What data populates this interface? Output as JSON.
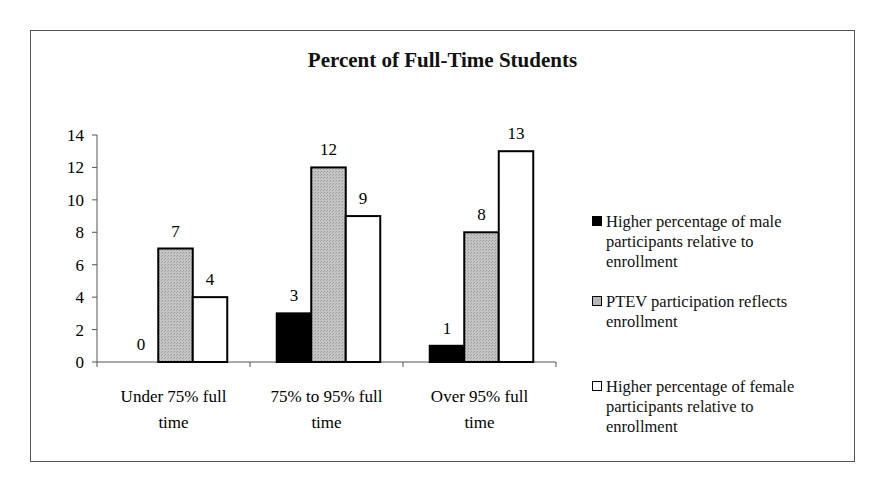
{
  "chart_data": {
    "type": "bar",
    "title": "Percent of Full-Time Students",
    "xlabel": "",
    "ylabel": "",
    "ylim": [
      0,
      14
    ],
    "yticks": [
      0,
      2,
      4,
      6,
      8,
      10,
      12,
      14
    ],
    "grid": false,
    "legend_position": "right",
    "categories": [
      "Under 75% full time",
      "75% to 95% full time",
      "Over 95% full time"
    ],
    "series": [
      {
        "name": "Higher percentage of male participants relative to enrollment",
        "color": "#000000",
        "values": [
          0,
          3,
          1
        ]
      },
      {
        "name": "PTEV participation reflects enrollment",
        "color": "#b8b8b8",
        "values": [
          7,
          12,
          8
        ]
      },
      {
        "name": "Higher percentage of female participants relative to enrollment",
        "color": "#ffffff",
        "values": [
          4,
          9,
          13
        ]
      }
    ],
    "data_labels": [
      [
        "0",
        "7",
        "4"
      ],
      [
        "3",
        "12",
        "9"
      ],
      [
        "1",
        "8",
        "13"
      ]
    ]
  },
  "chart": {
    "title": "Percent of Full-Time Students",
    "categories": [
      {
        "line1": "Under 75% full",
        "line2": "time"
      },
      {
        "line1": "75% to 95% full",
        "line2": "time"
      },
      {
        "line1": "Over 95% full",
        "line2": "time"
      }
    ],
    "legend": [
      {
        "lines": [
          "Higher percentage of male",
          "participants relative to",
          "enrollment"
        ]
      },
      {
        "lines": [
          "PTEV participation reflects",
          "enrollment"
        ]
      },
      {
        "lines": [
          "Higher percentage of female",
          "participants relative to",
          "enrollment"
        ]
      }
    ]
  }
}
